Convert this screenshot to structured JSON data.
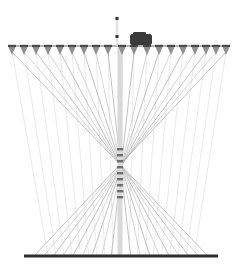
{
  "canvas": {
    "width": 238,
    "height": 277,
    "background": "#ffffff",
    "title": "Cable-stayed structure elevation"
  },
  "palette": {
    "cable": "#a8a8a8",
    "cable_light": "#c6c6c6",
    "rail_top": "#9a9a9a",
    "rail_bottom": "#2e2e2e",
    "marker_body": "#8f8f8f",
    "marker_dark": "#4a4a4a",
    "mast": "#d9d9d9",
    "mast_rung": "#6e6e6e",
    "silhouette": "#3a3a3a",
    "pole": "#e2e2e2",
    "pole_knob": "#333333"
  },
  "top_rail": {
    "label": "top-rail",
    "x1": 8,
    "x2": 230,
    "y": 46,
    "thickness": 1.6
  },
  "bottom_rail": {
    "label": "bottom-rail",
    "x1": 24,
    "x2": 218,
    "y": 256,
    "thickness": 3.2
  },
  "markers": {
    "label": "hanger-marker",
    "count": 19,
    "shape": "inverted-triangle",
    "width": 8,
    "height": 9,
    "y": 46,
    "positions": [
      12,
      24,
      36,
      48,
      60,
      72,
      84,
      96,
      108,
      122,
      134,
      147,
      159,
      171,
      183,
      195,
      206,
      216,
      226
    ]
  },
  "mast": {
    "label": "central-mast",
    "x": 120,
    "top": 46,
    "bottom": 256,
    "width": 5,
    "rung_count": 9,
    "rung_top": 148,
    "rung_spacing": 6
  },
  "pole": {
    "label": "signal-pole",
    "x": 117,
    "top": 16,
    "bottom": 46,
    "width": 2.4,
    "knob_top_y": 17,
    "knob_mid_y": 35,
    "knob_size": 3
  },
  "silhouette": {
    "label": "dark-object",
    "x": 130,
    "y": 34,
    "width": 22,
    "height": 11,
    "description": "dark object resting on top rail"
  },
  "cables": {
    "label": "cable-stay",
    "description": "Cables run from each top marker down and across to the opposite side of the bottom rail, crossing near the centre mast.",
    "stroke_width": 0.7,
    "anchor_spread_left": 34,
    "anchor_spread_right": 208
  },
  "chart_data": {
    "type": "line",
    "title": "Cable-stayed structure elevation",
    "xlabel": "",
    "ylabel": "",
    "xlim": [
      0,
      238
    ],
    "ylim": [
      277,
      0
    ],
    "grid": false,
    "legend": "none",
    "series": [
      {
        "name": "top-rail-markers",
        "x": [
          12,
          24,
          36,
          48,
          60,
          72,
          84,
          96,
          108,
          122,
          134,
          147,
          159,
          171,
          183,
          195,
          206,
          216,
          226
        ],
        "y": [
          46,
          46,
          46,
          46,
          46,
          46,
          46,
          46,
          46,
          46,
          46,
          46,
          46,
          46,
          46,
          46,
          46,
          46,
          46
        ]
      },
      {
        "name": "bottom-rail-anchors",
        "x": [
          40,
          48,
          56,
          64,
          72,
          80,
          88,
          96,
          104,
          118,
          132,
          140,
          148,
          156,
          164,
          172,
          180,
          188,
          196
        ],
        "y": [
          256,
          256,
          256,
          256,
          256,
          256,
          256,
          256,
          256,
          256,
          256,
          256,
          256,
          256,
          256,
          256,
          256,
          256,
          256
        ]
      }
    ]
  }
}
